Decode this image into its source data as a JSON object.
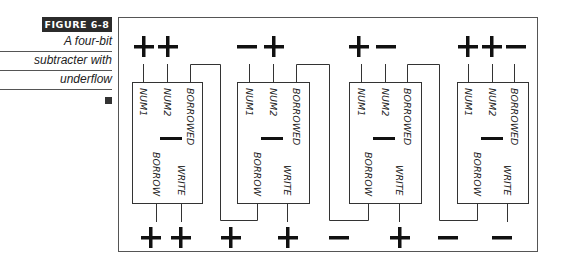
{
  "caption": {
    "figure_label": "FIGURE 6-8",
    "lines": [
      "A four-bit",
      "subtracter with",
      "underflow"
    ]
  },
  "diagram": {
    "stages": [
      {
        "inputs": [
          "+",
          "+"
        ],
        "pins_top": [
          "NUM1",
          "NUM2",
          "BORROWED"
        ],
        "pins_bottom": [
          "BORROW",
          "WRITE"
        ],
        "op_symbol": "−",
        "outputs": [
          "+",
          "+"
        ]
      },
      {
        "inputs": [
          "−",
          "+"
        ],
        "pins_top": [
          "NUM1",
          "NUM2",
          "BORROWED"
        ],
        "pins_bottom": [
          "BORROW",
          "WRITE"
        ],
        "op_symbol": "−",
        "outputs": [
          "+",
          "+"
        ]
      },
      {
        "inputs": [
          "+",
          "−"
        ],
        "pins_top": [
          "NUM1",
          "NUM2",
          "BORROWED"
        ],
        "pins_bottom": [
          "BORROW",
          "WRITE"
        ],
        "op_symbol": "−",
        "outputs": [
          "−",
          "+"
        ]
      },
      {
        "inputs": [
          "+",
          "+",
          "−"
        ],
        "pins_top": [
          "NUM1",
          "NUM2",
          "BORROWED"
        ],
        "pins_bottom": [
          "BORROW",
          "WRITE"
        ],
        "op_symbol": "−",
        "outputs": [
          "−",
          "−"
        ]
      }
    ]
  }
}
